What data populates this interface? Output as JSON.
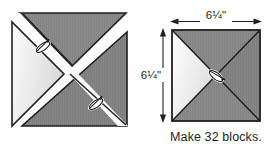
{
  "figure": {
    "type": "quilting-block-diagram",
    "caption": "Make 32 blocks.",
    "dimensions": {
      "width_label": "6¼\"",
      "height_label": "6¼\""
    },
    "colors": {
      "fabric_dark": "#8c8c8c",
      "fabric_dark_alt": "#7e7e7e",
      "fabric_light": "#ececec",
      "outline": "#231f20",
      "background": "#ffffff",
      "pin_fill": "#ffffff",
      "pin_outline": "#1a1a1a",
      "text": "#231f20"
    },
    "blocks": [
      {
        "id": "block-left",
        "name": "pieced-unit-with-sashing",
        "description": "Two half-square triangle units joined by a white diagonal band, pinned at two seam intersections",
        "pin_count": 2
      },
      {
        "id": "block-right",
        "name": "quarter-square-triangle-block",
        "description": "Finished square block made of four quarter-square triangles, one light and three dark, pinned at the center",
        "pin_count": 1
      }
    ]
  }
}
